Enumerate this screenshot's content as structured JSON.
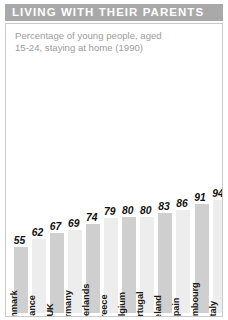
{
  "banner": {
    "title": "LIVING WITH THEIR PARENTS",
    "bg_color": "#a9a9a9",
    "text_color": "#ffffff"
  },
  "subtitle": "Percentage of young people, aged 15-24, staying at home (1990)",
  "colors": {
    "bar_dark": "#cfcfcf",
    "bar_light": "#ededed",
    "panel_border": "#c9c9c9",
    "subtitle_text": "#9d9d9d",
    "label_text": "#1a1a1a"
  },
  "chart_data": {
    "type": "bar",
    "title": "LIVING WITH THEIR PARENTS",
    "subtitle": "Percentage of young people, aged 15-24, staying at home (1990)",
    "xlabel": "",
    "ylabel": "",
    "ylim": [
      0,
      100
    ],
    "grid": false,
    "legend": "none",
    "categories": [
      "Denmark",
      "France",
      "UK",
      "Germany",
      "Netherlands",
      "Greece",
      "Belgium",
      "Portugal",
      "Ireland",
      "Spain",
      "Luxembourg",
      "Italy"
    ],
    "values": [
      55,
      62,
      67,
      69,
      74,
      79,
      80,
      80,
      83,
      86,
      91,
      94
    ],
    "value_labels": [
      "55",
      "62",
      "67",
      "69",
      "74",
      "79",
      "80",
      "80",
      "83",
      "86",
      "91",
      "94"
    ]
  }
}
